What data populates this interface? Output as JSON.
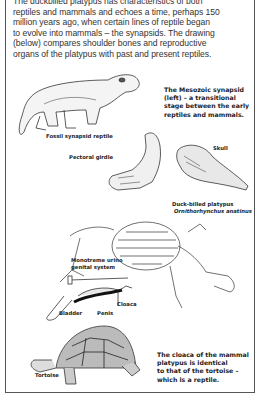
{
  "intro": {
    "lines": [
      "The duckbilled platypus has characteristics of both",
      "reptiles and mammals and echoes a time, perhaps 150",
      "million years ago, when certain lines of reptile began",
      "to evolve into mammals – the synapsids. The drawing",
      "(below) compares shoulder bones and reproductive",
      "organs of the platypus with past and present reptiles."
    ]
  },
  "illustrations": {
    "fossil_reptile": {
      "label": "Fossil synapsid reptile"
    },
    "pectoral_girdle": {
      "label": "Pectoral girdle"
    },
    "skull": {
      "label": "Skull"
    },
    "platypus": {
      "label": "Duck-billed platypus",
      "scientific_name": "Ornithorhynchus anatinus"
    },
    "urinogenital": {
      "label_line1": "Monotreme urino",
      "label_line2": "genital system",
      "parts": {
        "bladder": "Bladder",
        "penis": "Penis",
        "cloaca": "Cloaca"
      }
    },
    "tortoise": {
      "label": "Tortoise"
    }
  },
  "captions": {
    "mesozoic": [
      "The Mesozoic synapsid",
      "(left) – a transitional",
      "stage between the early",
      "reptiles and mammals."
    ],
    "cloaca": [
      "The cloaca of the mammal",
      "platypus is identical",
      "to that of the tortoise –",
      "which is a reptile."
    ]
  }
}
